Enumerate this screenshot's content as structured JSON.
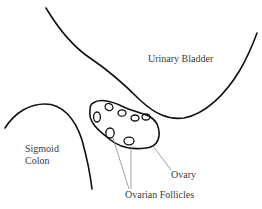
{
  "diagram": {
    "labels": {
      "urinary_bladder": "Urinary Bladder",
      "sigmoid_colon_line1": "Sigmoid",
      "sigmoid_colon_line2": "Colon",
      "ovary": "Ovary",
      "ovarian_follicles": "Ovarian Follicles"
    },
    "structures": [
      "Urinary Bladder",
      "Sigmoid Colon",
      "Ovary",
      "Ovarian Follicles"
    ],
    "follicle_count": 7,
    "colors": {
      "outline": "#111111",
      "leader_line": "#8a8a8a",
      "text": "#3a3a3a",
      "background": "#ffffff"
    }
  }
}
